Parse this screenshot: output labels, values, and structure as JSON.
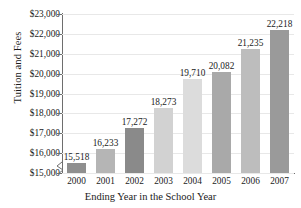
{
  "chart_data": {
    "type": "bar",
    "title": "",
    "xlabel": "Ending Year in the School Year",
    "ylabel": "Tuition and Fees",
    "categories": [
      "2000",
      "2001",
      "2002",
      "2003",
      "2004",
      "2005",
      "2006",
      "2007"
    ],
    "values": [
      15518,
      16233,
      17272,
      18273,
      19710,
      20082,
      21235,
      22218
    ],
    "value_labels": [
      "15,518",
      "16,233",
      "17,272",
      "18,273",
      "19,710",
      "20,082",
      "21,235",
      "22,218"
    ],
    "ylim": [
      15000,
      23000
    ],
    "y_ticks": [
      15000,
      16000,
      17000,
      18000,
      19000,
      20000,
      21000,
      22000,
      23000
    ],
    "y_tick_labels": [
      "$15,000",
      "$16,000",
      "$17,000",
      "$18,000",
      "$19,000",
      "$20,000",
      "$21,000",
      "$22,000",
      "$23,000"
    ],
    "grid": true,
    "legend": "none",
    "axis_break": true,
    "bar_colors": [
      "#8f8f8f",
      "#b5b5b5",
      "#8a8a8a",
      "#d2d2d2",
      "#dcdcdc",
      "#a9a9a9",
      "#bdbdbd",
      "#9a9a9a"
    ]
  },
  "axis_colors": {
    "spine": "#6e6e6e",
    "gridline": "#e8e8e8",
    "text": "#1a1a1a",
    "background": "#ffffff"
  }
}
